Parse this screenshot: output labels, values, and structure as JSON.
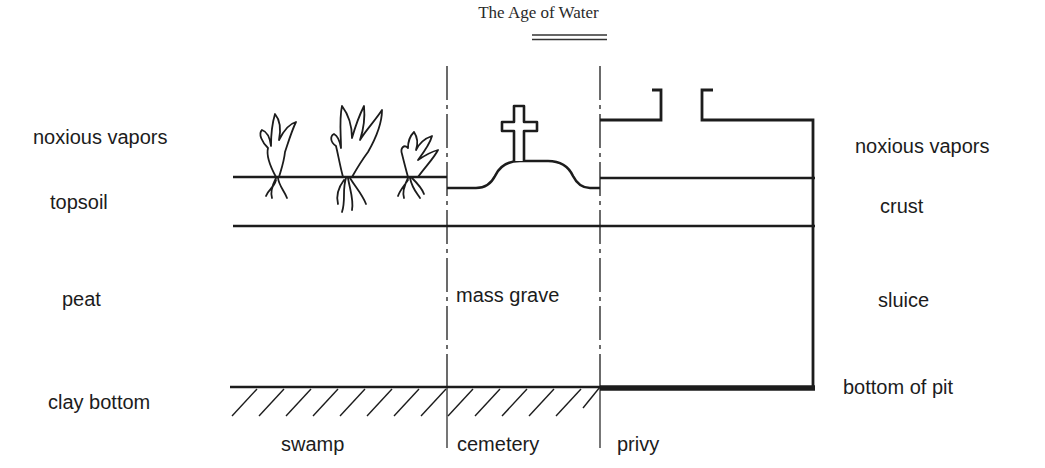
{
  "title": "The Age of Water",
  "left_labels": {
    "vapors": "noxious vapors",
    "topsoil": "topsoil",
    "peat": "peat",
    "clay": "clay bottom"
  },
  "right_labels": {
    "vapors": "noxious vapors",
    "crust": "crust",
    "sluice": "sluice",
    "pit_bottom": "bottom of pit"
  },
  "center_label": "mass grave",
  "zones": {
    "swamp": "swamp",
    "cemetery": "cemetery",
    "privy": "privy"
  },
  "colors": {
    "ink": "#1c1c1c",
    "background": "#ffffff"
  }
}
